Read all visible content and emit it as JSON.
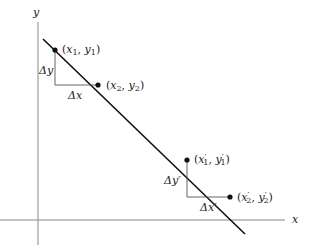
{
  "axes": {
    "x_label": "x",
    "y_label": "y",
    "axis_color": "#888888"
  },
  "line": {
    "color": "#111111"
  },
  "points": [
    {
      "id": "p1",
      "var_x": "x",
      "var_y": "y",
      "sub": "1",
      "prime": false
    },
    {
      "id": "p2",
      "var_x": "x",
      "var_y": "y",
      "sub": "2",
      "prime": false
    },
    {
      "id": "p3",
      "var_x": "x",
      "var_y": "y",
      "sub": "1",
      "prime": true
    },
    {
      "id": "p4",
      "var_x": "x",
      "var_y": "y",
      "sub": "2",
      "prime": true
    }
  ],
  "triangles": [
    {
      "dy_label": "Δy",
      "dx_label": "Δx"
    },
    {
      "dy_label": "Δy′",
      "dx_label": "Δx′"
    }
  ],
  "text": {
    "delta": "Δ",
    "x": "x",
    "y": "y",
    "prime": "′",
    "sub1": "1",
    "sub2": "2",
    "open": "(",
    "close": ")",
    "comma": ", "
  }
}
